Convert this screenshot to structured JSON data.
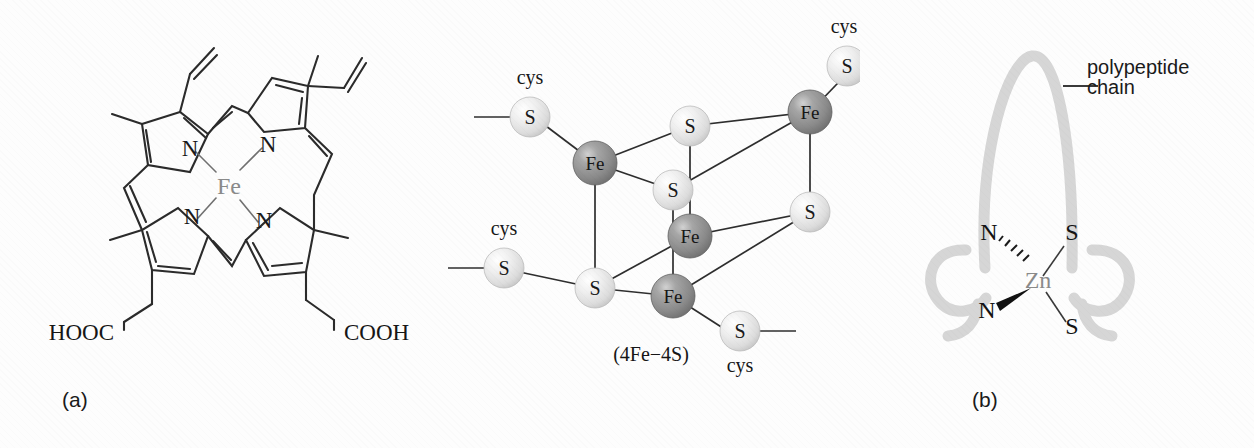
{
  "figure": {
    "background_color": "#fdfdfd",
    "bond_color": "#2b2b2b",
    "panels": [
      {
        "id": "a",
        "label": "(a)",
        "subject": "heme-b-iron-porphyrin"
      },
      {
        "id": "b",
        "label": "(b)",
        "subject": "iron-sulfur-cluster"
      },
      {
        "id": "c",
        "label": "(c)",
        "subject": "zinc-finger-site"
      }
    ]
  },
  "panel_a": {
    "label": "(a)",
    "metal_label": "Fe",
    "metal_color": "#8a8a8a",
    "nitrogen_labels": [
      "N",
      "N",
      "N",
      "N"
    ],
    "acid_label_left": "HOOC",
    "acid_label_right": "COOH",
    "substituents": {
      "methyl_count": 4,
      "vinyl_count": 2,
      "propionate_count": 2
    }
  },
  "panel_b": {
    "label": "(b)",
    "caption": "(4Fe−4S)",
    "iron_label": "Fe",
    "sulfur_label": "S",
    "cysteine_label": "cys",
    "iron_color": "#8f8f8f",
    "sulfur_color": "#e3e3e3",
    "iron_count": 4,
    "sulfur_core_count": 4,
    "cysteine_count": 4,
    "cysteine_labels": [
      "cys",
      "cys",
      "cys",
      "cys"
    ],
    "core_iron_labels": [
      "Fe",
      "Fe",
      "Fe",
      "Fe"
    ],
    "core_sulfur_labels": [
      "S",
      "S",
      "S",
      "S"
    ],
    "ligand_sulfur_labels": [
      "S",
      "S",
      "S",
      "S"
    ]
  },
  "panel_c": {
    "label": "(c)",
    "metal_label": "Zn",
    "metal_color": "#8a8a8a",
    "ligand_labels": {
      "n_top": "N",
      "n_bottom": "N",
      "s_top": "S",
      "s_bottom": "S"
    },
    "annotation": "polypeptide\nchain",
    "chain_color": "#d5d5d5"
  }
}
